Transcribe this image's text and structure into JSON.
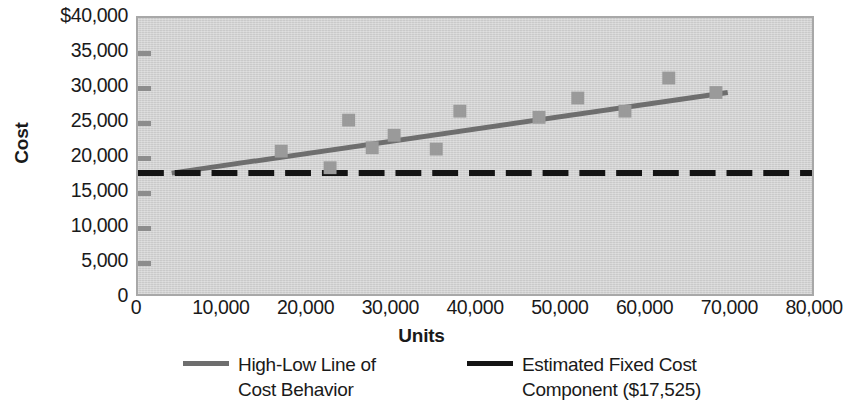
{
  "chart_data": {
    "type": "scatter",
    "title": "",
    "xlabel": "Units",
    "ylabel": "Cost",
    "xlim": [
      0,
      80000
    ],
    "ylim": [
      0,
      40000
    ],
    "grid": false,
    "legend_position": "bottom",
    "x_ticks": [
      "0",
      "10,000",
      "20,000",
      "30,000",
      "40,000",
      "50,000",
      "60,000",
      "70,000",
      "80,000"
    ],
    "x_tick_values": [
      0,
      10000,
      20000,
      30000,
      40000,
      50000,
      60000,
      70000,
      80000
    ],
    "y_ticks": [
      "0",
      "5,000",
      "10,000",
      "15,000",
      "20,000",
      "25,000",
      "30,000",
      "35,000",
      "$40,000"
    ],
    "y_tick_values": [
      0,
      5000,
      10000,
      15000,
      20000,
      25000,
      30000,
      35000,
      40000
    ],
    "scatter_color": "#9a9a9a",
    "points": [
      {
        "x": 17000,
        "y": 20700
      },
      {
        "x": 22800,
        "y": 18300
      },
      {
        "x": 25000,
        "y": 25200
      },
      {
        "x": 27800,
        "y": 21200
      },
      {
        "x": 30400,
        "y": 23000
      },
      {
        "x": 35400,
        "y": 21000
      },
      {
        "x": 38200,
        "y": 26500
      },
      {
        "x": 47600,
        "y": 25600
      },
      {
        "x": 52200,
        "y": 28400
      },
      {
        "x": 57800,
        "y": 26500
      },
      {
        "x": 63000,
        "y": 31300
      },
      {
        "x": 68600,
        "y": 29200
      }
    ],
    "series": [
      {
        "name": "High-Low Line of Cost Behavior",
        "type": "line",
        "style": "solid",
        "color": "#6e6e6e",
        "x": [
          4000,
          70000
        ],
        "y": [
          17525,
          29200
        ]
      },
      {
        "name": "Estimated Fixed Cost Component ($17,525)",
        "type": "line",
        "style": "dashed",
        "color": "#141414",
        "x": [
          0,
          80000
        ],
        "y": [
          17525,
          17525
        ],
        "value": 17525
      }
    ]
  },
  "legend": {
    "entries": [
      {
        "label": "High-Low Line of\nCost Behavior",
        "color": "#6e6e6e",
        "style": "solid"
      },
      {
        "label": "Estimated Fixed Cost\nComponent ($17,525)",
        "color": "#141414",
        "style": "solid"
      }
    ]
  }
}
